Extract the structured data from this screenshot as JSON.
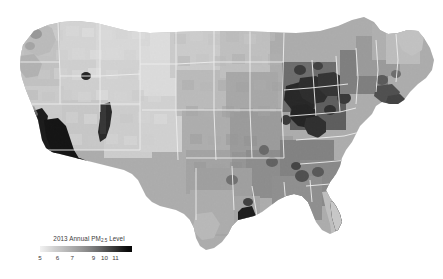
{
  "figure": {
    "background_color": "#ffffff",
    "width": 443,
    "height": 279
  },
  "legend": {
    "name": "colorbar-legend",
    "title_prefix": "2013 Annual PM",
    "title_subscript": "2.5",
    "title_suffix": " Level",
    "title_full": "2013 Annual PM2.5 Level",
    "orientation": "horizontal",
    "position": "bottom-left",
    "ticks": [
      {
        "label": "5",
        "value": 5,
        "pos_pct": 0
      },
      {
        "label": "6",
        "value": 6,
        "pos_pct": 19
      },
      {
        "label": "7",
        "value": 7,
        "pos_pct": 35
      },
      {
        "label": "9",
        "value": 9,
        "pos_pct": 58
      },
      {
        "label": "10",
        "value": 10,
        "pos_pct": 70
      },
      {
        "label": "11",
        "value": 11,
        "pos_pct": 82
      }
    ],
    "low_color": "#f2f2f2",
    "high_color": "#050505",
    "colormap": "greys"
  },
  "chart_data": {
    "type": "heatmap",
    "subtype": "choropleth-map",
    "title": "2013 Annual PM2.5 Level",
    "xlabel": "",
    "ylabel": "",
    "region": "Contiguous United States",
    "geographic_unit": "county",
    "variable": "Annual mean PM2.5 concentration",
    "units": "ug/m3",
    "colormap": "greys",
    "color_scale_low": "#f2f2f2",
    "color_scale_high": "#050505",
    "value_range": [
      5,
      11
    ],
    "legend_position": "bottom-left",
    "grid": false,
    "axes_visible": false,
    "state_border_color": "#e8e8e8",
    "regions": [
      {
        "name": "California Central Valley",
        "value": 11.5,
        "shade": "#0a0a0a"
      },
      {
        "name": "Los Angeles Basin / Southern California",
        "value": 11.4,
        "shade": "#101010"
      },
      {
        "name": "San Joaquin Valley",
        "value": 11.5,
        "shade": "#0c0c0c"
      },
      {
        "name": "Utah Wasatch Front",
        "value": 10.6,
        "shade": "#242424"
      },
      {
        "name": "Salt Lake City",
        "value": 10.2,
        "shade": "#2c2c2c"
      },
      {
        "name": "Ohio Valley",
        "value": 10.8,
        "shade": "#1c1c1c"
      },
      {
        "name": "Western Pennsylvania / Pittsburgh",
        "value": 10.9,
        "shade": "#181818"
      },
      {
        "name": "Indiana / Illinois industrial belt",
        "value": 10.5,
        "shade": "#222222"
      },
      {
        "name": "Chicago metro",
        "value": 10.4,
        "shade": "#262626"
      },
      {
        "name": "Cleveland / Northeast Ohio",
        "value": 10.7,
        "shade": "#1e1e1e"
      },
      {
        "name": "Houston / Gulf Coast Texas",
        "value": 10.6,
        "shade": "#1f1f1f"
      },
      {
        "name": "Birmingham Alabama",
        "value": 10.3,
        "shade": "#2a2a2a"
      },
      {
        "name": "Atlanta metro",
        "value": 9.7,
        "shade": "#3e3e3e"
      },
      {
        "name": "New York / New Jersey metro",
        "value": 9.8,
        "shade": "#3a3a3a"
      },
      {
        "name": "Southeastern United States",
        "value": 8.8,
        "shade": "#6a6a6a"
      },
      {
        "name": "Mid-Atlantic",
        "value": 9.2,
        "shade": "#545454"
      },
      {
        "name": "Great Plains",
        "value": 7.2,
        "shade": "#b4b4b4"
      },
      {
        "name": "Northern Great Plains / Dakotas",
        "value": 6.0,
        "shade": "#dcdcdc"
      },
      {
        "name": "Montana / Wyoming",
        "value": 5.8,
        "shade": "#e2e2e2"
      },
      {
        "name": "Nevada / Great Basin",
        "value": 5.6,
        "shade": "#e6e6e6"
      },
      {
        "name": "Pacific Northwest coast",
        "value": 6.6,
        "shade": "#cfcfcf"
      },
      {
        "name": "Florida peninsula",
        "value": 7.0,
        "shade": "#bfbfbf"
      },
      {
        "name": "Northern New England / Maine",
        "value": 6.4,
        "shade": "#d4d4d4"
      },
      {
        "name": "Arizona / New Mexico",
        "value": 6.2,
        "shade": "#d8d8d8"
      }
    ]
  }
}
